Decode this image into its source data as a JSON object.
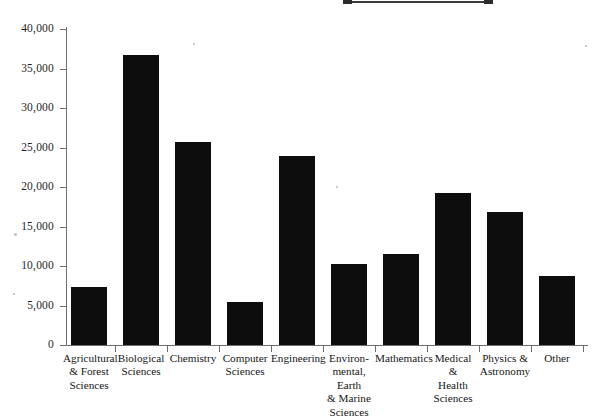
{
  "artifacts": {
    "top_rule_label": "scan-edge-rule"
  },
  "chart_data": {
    "type": "bar",
    "title": "",
    "xlabel": "",
    "ylabel": "",
    "ylim": [
      0,
      40000
    ],
    "grid": false,
    "legend": null,
    "categories": [
      "Agricultural\n& Forest\nSciences",
      "Biological\nSciences",
      "Chemistry",
      "Computer\nSciences",
      "Engineering",
      "Environ-\nmental, Earth\n& Marine\nSciences",
      "Mathematics",
      "Medical\n&\nHealth\nSciences",
      "Physics &\nAstronomy",
      "Other"
    ],
    "values": [
      7400,
      36700,
      25700,
      5400,
      23900,
      10300,
      11500,
      19300,
      16800,
      8700
    ],
    "bar_color": "#0d0d0d",
    "axis_color": "#6e6e6e",
    "y_ticks": [
      0,
      5000,
      10000,
      15000,
      20000,
      25000,
      30000,
      35000,
      40000
    ],
    "y_tick_labels": [
      "0",
      "5,000",
      "10,000",
      "15,000",
      "20,000",
      "25,000",
      "30,000",
      "35,000",
      "40,000"
    ]
  }
}
